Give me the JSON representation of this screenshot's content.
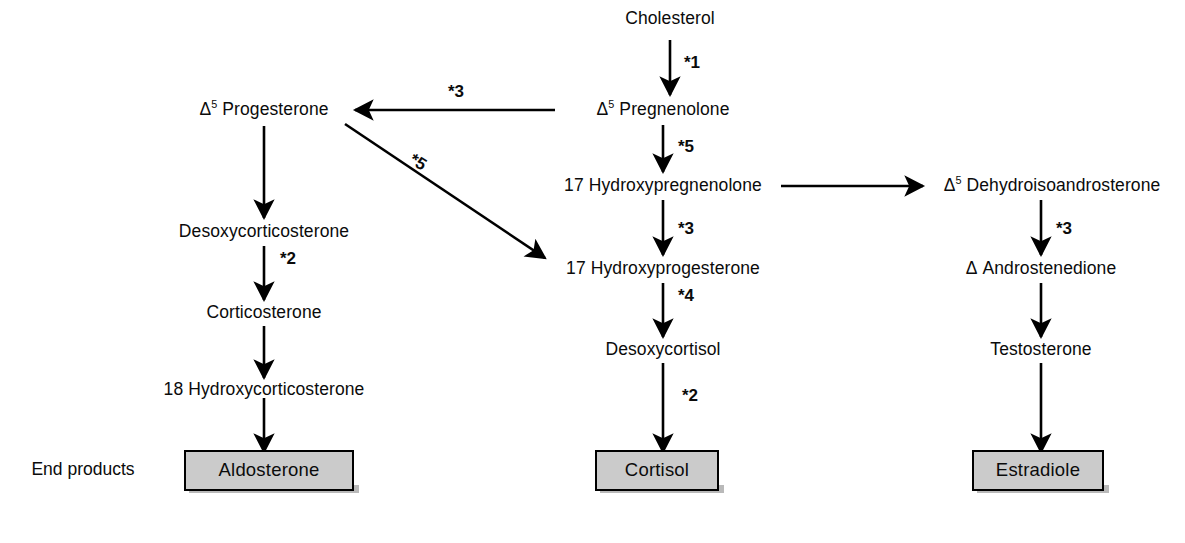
{
  "diagram": {
    "end_products_label": "End products",
    "colors": {
      "line": "#000000",
      "text": "#0b0b0b",
      "box_fill": "#cbcbcb",
      "box_border": "#000000",
      "background": "#ffffff"
    },
    "nodes": [
      {
        "id": "cholesterol",
        "label": "Cholesterol",
        "prefix": "",
        "sup": ""
      },
      {
        "id": "pregnenolone",
        "label": " Pregnenolone",
        "prefix": "Δ",
        "sup": "5"
      },
      {
        "id": "progesterone",
        "label": " Progesterone",
        "prefix": "Δ",
        "sup": "5"
      },
      {
        "id": "hydroxypregnenolone",
        "label": "17 Hydroxypregnenolone",
        "prefix": "",
        "sup": ""
      },
      {
        "id": "dehydroisoandrosterone",
        "label": " Dehydroisoandrosterone",
        "prefix": "Δ",
        "sup": "5"
      },
      {
        "id": "desoxycorticosterone",
        "label": "Desoxycorticosterone",
        "prefix": "",
        "sup": ""
      },
      {
        "id": "hydroxyprogesterone",
        "label": "17 Hydroxyprogesterone",
        "prefix": "",
        "sup": ""
      },
      {
        "id": "androstenedione",
        "label": " Androstenedione",
        "prefix": "Δ",
        "sup": ""
      },
      {
        "id": "corticosterone",
        "label": "Corticosterone",
        "prefix": "",
        "sup": ""
      },
      {
        "id": "desoxycortisol",
        "label": "Desoxycortisol",
        "prefix": "",
        "sup": ""
      },
      {
        "id": "testosterone",
        "label": "Testosterone",
        "prefix": "",
        "sup": ""
      },
      {
        "id": "hydroxycorticosterone",
        "label": "18 Hydroxycorticosterone",
        "prefix": "",
        "sup": ""
      }
    ],
    "end_products": [
      {
        "id": "aldosterone",
        "label": "Aldosterone"
      },
      {
        "id": "cortisol",
        "label": "Cortisol"
      },
      {
        "id": "estradiole",
        "label": "Estradiole"
      }
    ],
    "enzyme_labels": [
      {
        "id": "chol-to-preg",
        "label": "*1"
      },
      {
        "id": "preg-to-prog",
        "label": "*3"
      },
      {
        "id": "preg-to-17oh-preg",
        "label": "*5"
      },
      {
        "id": "prog-to-17oh-prog",
        "label": "*5"
      },
      {
        "id": "dcs-to-cs",
        "label": "*2"
      },
      {
        "id": "17ohpreg-to-17ohprog",
        "label": "*3"
      },
      {
        "id": "17ohprog-to-dcortisol",
        "label": "*4"
      },
      {
        "id": "dcortisol-to-cortisol",
        "label": "*2"
      },
      {
        "id": "dhea-to-andro",
        "label": "*3"
      }
    ],
    "reactions": [
      {
        "from": "cholesterol",
        "to": "pregnenolone",
        "enzyme": "*1"
      },
      {
        "from": "pregnenolone",
        "to": "progesterone",
        "enzyme": "*3"
      },
      {
        "from": "pregnenolone",
        "to": "hydroxypregnenolone",
        "enzyme": "*5"
      },
      {
        "from": "progesterone",
        "to": "desoxycorticosterone",
        "enzyme": ""
      },
      {
        "from": "progesterone",
        "to": "hydroxyprogesterone",
        "enzyme": "*5"
      },
      {
        "from": "hydroxypregnenolone",
        "to": "dehydroisoandrosterone",
        "enzyme": ""
      },
      {
        "from": "hydroxypregnenolone",
        "to": "hydroxyprogesterone",
        "enzyme": "*3"
      },
      {
        "from": "desoxycorticosterone",
        "to": "corticosterone",
        "enzyme": "*2"
      },
      {
        "from": "corticosterone",
        "to": "hydroxycorticosterone",
        "enzyme": ""
      },
      {
        "from": "hydroxycorticosterone",
        "to": "aldosterone",
        "enzyme": ""
      },
      {
        "from": "hydroxyprogesterone",
        "to": "desoxycortisol",
        "enzyme": "*4"
      },
      {
        "from": "desoxycortisol",
        "to": "cortisol",
        "enzyme": "*2"
      },
      {
        "from": "dehydroisoandrosterone",
        "to": "androstenedione",
        "enzyme": "*3"
      },
      {
        "from": "androstenedione",
        "to": "testosterone",
        "enzyme": ""
      },
      {
        "from": "testosterone",
        "to": "estradiole",
        "enzyme": ""
      }
    ]
  }
}
